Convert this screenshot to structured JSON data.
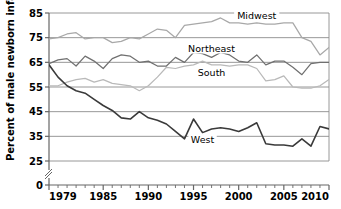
{
  "chart_data": {
    "type": "line",
    "title": "",
    "xlabel": "",
    "ylabel": "Percent of male newborn infants",
    "xlim": [
      1979,
      2010
    ],
    "ylim": [
      0,
      85
    ],
    "y_axis_break": true,
    "y_break_between": [
      0,
      25
    ],
    "grid": true,
    "grid_axis": "y",
    "legend_position": "inline-labels",
    "yticks": [
      0,
      25,
      35,
      45,
      55,
      65,
      75,
      85
    ],
    "ytick_labels": [
      "0",
      "25",
      "35",
      "45",
      "55",
      "65",
      "75",
      "85"
    ],
    "xticks": [
      1979,
      1980,
      1981,
      1982,
      1983,
      1984,
      1985,
      1986,
      1987,
      1988,
      1989,
      1990,
      1991,
      1992,
      1993,
      1994,
      1995,
      1996,
      1997,
      1998,
      1999,
      2000,
      2001,
      2002,
      2003,
      2004,
      2005,
      2006,
      2007,
      2008,
      2009,
      2010
    ],
    "xtick_labels_shown": [
      "1979",
      "1985",
      "1990",
      "1995",
      "2000",
      "2005",
      "2010"
    ],
    "xtick_labels_shown_values": [
      1979,
      1985,
      1990,
      1995,
      2000,
      2005,
      2010
    ],
    "x": [
      1979,
      1980,
      1981,
      1982,
      1983,
      1984,
      1985,
      1986,
      1987,
      1988,
      1989,
      1990,
      1991,
      1992,
      1993,
      1994,
      1995,
      1996,
      1997,
      1998,
      1999,
      2000,
      2001,
      2002,
      2003,
      2004,
      2005,
      2006,
      2007,
      2008,
      2009,
      2010
    ],
    "series": [
      {
        "name": "Midwest",
        "color": "#a8a8a8",
        "label_x": 2002,
        "label_y": 83,
        "values": [
          74.5,
          75.0,
          76.5,
          77.0,
          74.5,
          75.0,
          75.0,
          73.0,
          73.5,
          75.0,
          74.5,
          76.5,
          78.5,
          78.0,
          75.0,
          80.0,
          80.5,
          81.0,
          81.5,
          83.0,
          81.0,
          81.0,
          80.5,
          81.0,
          80.5,
          80.5,
          81.0,
          81.0,
          75.0,
          73.5,
          68.0,
          71.0
        ]
      },
      {
        "name": "Northeast",
        "color": "#707070",
        "label_x": 1997,
        "label_y": 70,
        "values": [
          64.5,
          66.0,
          66.5,
          63.5,
          67.5,
          65.5,
          62.5,
          66.5,
          68.0,
          67.5,
          65.0,
          65.5,
          63.5,
          63.5,
          67.0,
          65.0,
          69.0,
          68.5,
          67.0,
          69.0,
          68.0,
          65.5,
          65.0,
          68.0,
          64.0,
          65.5,
          65.5,
          63.0,
          60.0,
          64.5,
          65.0,
          65.0
        ]
      },
      {
        "name": "South",
        "color": "#b9b9b9",
        "label_x": 1997,
        "label_y": 60,
        "values": [
          55.5,
          55.5,
          57.0,
          58.0,
          58.5,
          57.0,
          58.0,
          56.5,
          56.0,
          55.5,
          53.5,
          55.5,
          59.0,
          63.0,
          62.5,
          63.5,
          64.0,
          65.5,
          64.0,
          64.0,
          63.5,
          64.0,
          64.0,
          62.5,
          57.5,
          58.0,
          59.5,
          55.0,
          54.5,
          54.5,
          55.5,
          58.0
        ]
      },
      {
        "name": "West",
        "color": "#3a3a3a",
        "label_x": 1996,
        "label_y": 33,
        "values": [
          64.0,
          59.0,
          55.5,
          53.5,
          52.5,
          50.0,
          47.5,
          45.5,
          42.5,
          42.0,
          45.0,
          42.5,
          41.5,
          40.0,
          37.0,
          34.0,
          42.0,
          36.5,
          38.0,
          38.5,
          38.0,
          37.0,
          38.5,
          40.5,
          32.0,
          31.5,
          31.5,
          31.0,
          34.0,
          31.0,
          39.0,
          38.0
        ]
      }
    ]
  }
}
